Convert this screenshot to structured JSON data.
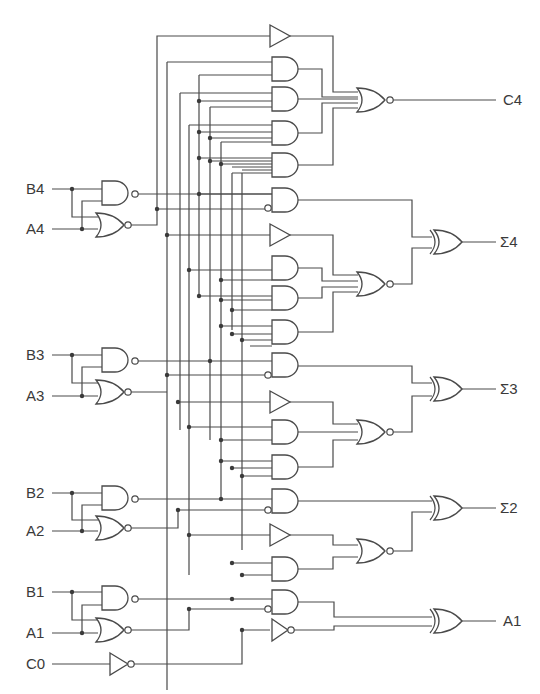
{
  "diagram": {
    "type": "logic-circuit",
    "inputs": [
      {
        "label": "B4"
      },
      {
        "label": "A4"
      },
      {
        "label": "B3"
      },
      {
        "label": "A3"
      },
      {
        "label": "B2"
      },
      {
        "label": "A2"
      },
      {
        "label": "B1"
      },
      {
        "label": "A1"
      },
      {
        "label": "C0"
      }
    ],
    "outputs": [
      {
        "label": "C4"
      },
      {
        "label": "Σ4"
      },
      {
        "label": "Σ3"
      },
      {
        "label": "Σ2"
      },
      {
        "label": "A1"
      }
    ],
    "colors": {
      "line": "#4a4a4a",
      "background": "#ffffff",
      "text": "#3a3a3a"
    }
  }
}
